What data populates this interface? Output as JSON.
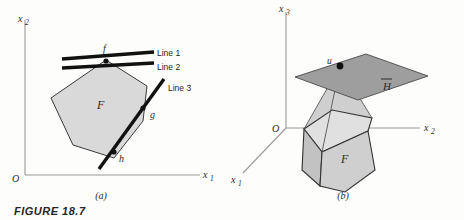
{
  "figure": {
    "caption": "FIGURE 18.7",
    "panels": [
      {
        "id": "a",
        "letter": "(a)",
        "dimension": "2D",
        "origin_label": "O",
        "axes": [
          {
            "name": "x1",
            "label": "x",
            "subscript": "1",
            "orientation": "horizontal"
          },
          {
            "name": "x2",
            "label": "x",
            "subscript": "2",
            "orientation": "vertical"
          }
        ],
        "region_label": "F",
        "vertices": [
          {
            "name": "f",
            "label": "f"
          },
          {
            "name": "g",
            "label": "g"
          },
          {
            "name": "h",
            "label": "h"
          }
        ],
        "lines": [
          {
            "name": "line-1",
            "label": "Line 1"
          },
          {
            "name": "line-2",
            "label": "Line 2"
          },
          {
            "name": "line-3",
            "label": "Line 3"
          }
        ]
      },
      {
        "id": "b",
        "letter": "(b)",
        "dimension": "3D",
        "origin_label": "O",
        "axes": [
          {
            "name": "x1",
            "label": "x",
            "subscript": "1",
            "orientation": "depth"
          },
          {
            "name": "x2",
            "label": "x",
            "subscript": "2",
            "orientation": "horizontal"
          },
          {
            "name": "x3",
            "label": "x",
            "subscript": "3",
            "orientation": "vertical"
          }
        ],
        "region_label": "F",
        "plane_label": "H",
        "plane_label_has_overbar": true,
        "point_label": "u"
      }
    ]
  },
  "colors": {
    "polygon_fill": "#d9d9d9",
    "plane_fill": "#9e9e9e",
    "solid_front_fill": "#cfcfcf",
    "solid_left_fill": "#c2c2c2",
    "solid_top_fill": "#e0e0e0",
    "cone_fill": "#cccccc",
    "thick_line": "#111111",
    "axis": "#9a9a9a",
    "text": "#2b2b2b",
    "background": "#fdfdfc"
  }
}
